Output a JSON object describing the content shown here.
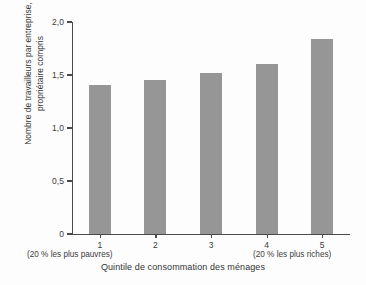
{
  "chart_data": {
    "type": "bar",
    "title": "",
    "subtitle": "",
    "xlabel": "Quintile de consommation des ménages",
    "ylabel": "Nombre de travailleurs par entreprise, propriétaire compris",
    "categories": [
      "1",
      "2",
      "3",
      "4",
      "5"
    ],
    "values": [
      1.41,
      1.45,
      1.52,
      1.6,
      1.84
    ],
    "ylim": [
      0,
      2.0
    ],
    "y_ticks": [
      "0",
      "0,5",
      "1,0",
      "1,5",
      "2,0"
    ],
    "y_tick_values": [
      0,
      0.5,
      1.0,
      1.5,
      2.0
    ],
    "grid": false,
    "legend": null,
    "annotations": [
      {
        "text": "(20 % les plus pauvres)",
        "position": "below-category-1"
      },
      {
        "text": "(20 % les plus riches)",
        "position": "below-category-5"
      }
    ],
    "series": [
      {
        "name": "Nombre de travailleurs par entreprise",
        "values": [
          1.41,
          1.45,
          1.52,
          1.6,
          1.84
        ]
      }
    ],
    "colors": {
      "bar_fill": "#969696",
      "axis": "#4a4a4a",
      "text": "#3a3a3a",
      "background": "#fdfdfd"
    }
  },
  "axis": {
    "y_title_line1": "Nombre de travailleurs par entreprise,",
    "y_title_line2": "propriétaire compris",
    "x_title": "Quintile de consommation des ménages"
  },
  "notes": {
    "poorest": "(20 % les plus pauvres)",
    "richest": "(20 % les plus riches)"
  }
}
